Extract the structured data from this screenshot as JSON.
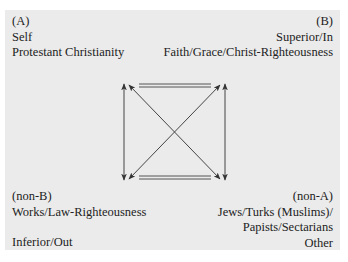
{
  "diagram": {
    "type": "semiotic-square",
    "background_color": "#ebebeb",
    "line_color": "#444444",
    "corners": {
      "top_left": {
        "label": "(A)",
        "lines": [
          "Self",
          "Protestant Christianity"
        ]
      },
      "top_right": {
        "label": "(B)",
        "lines": [
          "Superior/In",
          "Faith/Grace/Christ-Righteousness"
        ]
      },
      "bottom_left": {
        "label": "(non-B)",
        "lines": [
          "Works/Law-Righteousness",
          "Inferior/Out"
        ]
      },
      "bottom_right": {
        "label": "(non-A)",
        "lines": [
          "Jews/Turks (Muslims)/",
          "Papists/Sectarians",
          "Other"
        ]
      }
    },
    "connections": [
      {
        "from": "top_left",
        "to": "top_right",
        "style": "double-line"
      },
      {
        "from": "bottom_left",
        "to": "bottom_right",
        "style": "double-line"
      },
      {
        "from": "top_left",
        "to": "bottom_left",
        "style": "double-arrow"
      },
      {
        "from": "top_right",
        "to": "bottom_right",
        "style": "double-arrow"
      },
      {
        "from": "top_left",
        "to": "bottom_right",
        "style": "double-arrow"
      },
      {
        "from": "top_right",
        "to": "bottom_left",
        "style": "double-arrow"
      }
    ]
  }
}
